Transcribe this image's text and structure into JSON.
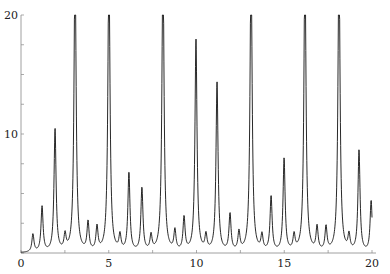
{
  "chart_data": {
    "type": "line",
    "title": "",
    "xlabel": "",
    "ylabel": "",
    "xlim": [
      0,
      20
    ],
    "ylim": [
      0,
      20
    ],
    "xticks": [
      0,
      5,
      10,
      15,
      20
    ],
    "yticks": [
      10,
      20
    ],
    "grid": false,
    "legend": null,
    "peak_width": 0.07,
    "peaks": [
      {
        "x": 0.68,
        "y": 1.5
      },
      {
        "x": 1.2,
        "y": 3.8
      },
      {
        "x": 1.94,
        "y": 10.3
      },
      {
        "x": 2.51,
        "y": 1.3
      },
      {
        "x": 3.08,
        "y": 25
      },
      {
        "x": 3.82,
        "y": 2.4
      },
      {
        "x": 4.33,
        "y": 2.0
      },
      {
        "x": 5.01,
        "y": 25
      },
      {
        "x": 5.64,
        "y": 1.3
      },
      {
        "x": 6.15,
        "y": 6.6
      },
      {
        "x": 6.89,
        "y": 5.3
      },
      {
        "x": 7.41,
        "y": 1.3
      },
      {
        "x": 8.09,
        "y": 25
      },
      {
        "x": 8.77,
        "y": 1.7
      },
      {
        "x": 9.29,
        "y": 2.8
      },
      {
        "x": 9.97,
        "y": 17.8
      },
      {
        "x": 10.54,
        "y": 1.3
      },
      {
        "x": 11.17,
        "y": 14.2
      },
      {
        "x": 11.91,
        "y": 3.1
      },
      {
        "x": 12.42,
        "y": 1.6
      },
      {
        "x": 13.11,
        "y": 25
      },
      {
        "x": 13.73,
        "y": 1.3
      },
      {
        "x": 14.25,
        "y": 4.6
      },
      {
        "x": 14.99,
        "y": 7.8
      },
      {
        "x": 15.56,
        "y": 1.3
      },
      {
        "x": 16.18,
        "y": 25
      },
      {
        "x": 16.87,
        "y": 2.0
      },
      {
        "x": 17.38,
        "y": 2.0
      },
      {
        "x": 18.12,
        "y": 25
      },
      {
        "x": 18.69,
        "y": 1.3
      },
      {
        "x": 19.26,
        "y": 8.5
      },
      {
        "x": 19.95,
        "y": 4.3
      }
    ]
  }
}
